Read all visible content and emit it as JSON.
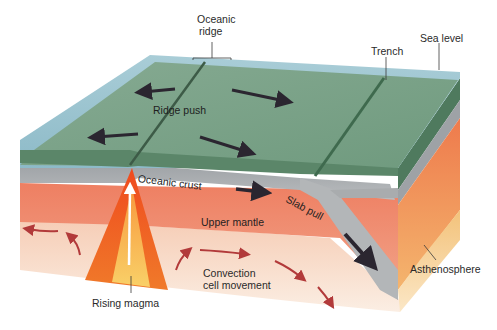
{
  "diagram": {
    "type": "block-diagram",
    "labels": {
      "oceanic_ridge_line1": "Oceanic",
      "oceanic_ridge_line2": "ridge",
      "trench": "Trench",
      "sea_level": "Sea level",
      "ridge_push": "Ridge push",
      "oceanic_crust": "Oceanic crust",
      "slab_pull": "Slab pull",
      "upper_mantle": "Upper mantle",
      "asthenosphere": "Asthenosphere",
      "convection_line1": "Convection",
      "convection_line2": "cell movement",
      "rising_magma": "Rising magma"
    },
    "colors": {
      "sea_surface": "#9cc3cf",
      "sea_edge": "#7fb0c0",
      "sea_floor_top": "#7fa38a",
      "sea_floor_dark": "#4f7a5e",
      "crust_side": "#5e8a6c",
      "oceanic_crust": "#a9acae",
      "upper_mantle": "#ec8a6a",
      "asthenosphere": "#f7d8c0",
      "asthenosphere_side": "#f3c98f",
      "magma_outer": "#e8421c",
      "magma_inner": "#f9c45a",
      "arrow_dark": "#2b2630",
      "arrow_red": "#b23a3a",
      "label_text": "#2a2a2a"
    }
  }
}
